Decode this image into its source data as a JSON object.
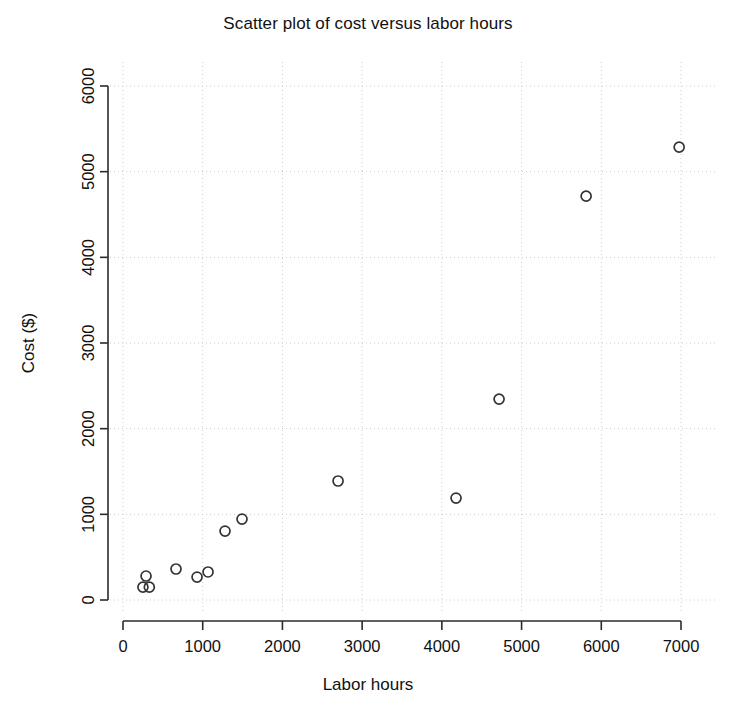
{
  "chart_data": {
    "type": "scatter",
    "title": "Scatter plot of cost versus labor hours",
    "xlabel": "Labor hours",
    "ylabel": "Cost ($)",
    "xlim": [
      0,
      7000
    ],
    "ylim": [
      0,
      6000
    ],
    "xticks": [
      0,
      1000,
      2000,
      3000,
      4000,
      5000,
      6000,
      7000
    ],
    "yticks": [
      0,
      1000,
      2000,
      3000,
      4000,
      5000,
      6000
    ],
    "xtick_labels": [
      "0",
      "1000",
      "2000",
      "3000",
      "4000",
      "5000",
      "6000",
      "7000"
    ],
    "ytick_labels": [
      "0",
      "1000",
      "2000",
      "3000",
      "4000",
      "5000",
      "6000"
    ],
    "grid": true,
    "grid_style": "dotted",
    "grid_color": "#cccccc",
    "legend": false,
    "marker": "open-circle",
    "marker_color": "#333333",
    "marker_size": 5,
    "x": [
      289,
      250,
      330,
      665,
      929,
      1067,
      1280,
      1493,
      2698,
      4178,
      4718,
      5810,
      6977
    ],
    "y": [
      280,
      150,
      150,
      362,
      268,
      327,
      805,
      945,
      1389,
      1190,
      2345,
      4714,
      5286
    ],
    "points": [
      {
        "x": 289,
        "y": 280
      },
      {
        "x": 250,
        "y": 150
      },
      {
        "x": 330,
        "y": 150
      },
      {
        "x": 665,
        "y": 362
      },
      {
        "x": 929,
        "y": 268
      },
      {
        "x": 1067,
        "y": 327
      },
      {
        "x": 1280,
        "y": 805
      },
      {
        "x": 1493,
        "y": 945
      },
      {
        "x": 2698,
        "y": 1389
      },
      {
        "x": 4178,
        "y": 1190
      },
      {
        "x": 4718,
        "y": 2345
      },
      {
        "x": 5810,
        "y": 4714
      },
      {
        "x": 6977,
        "y": 5286
      }
    ]
  }
}
